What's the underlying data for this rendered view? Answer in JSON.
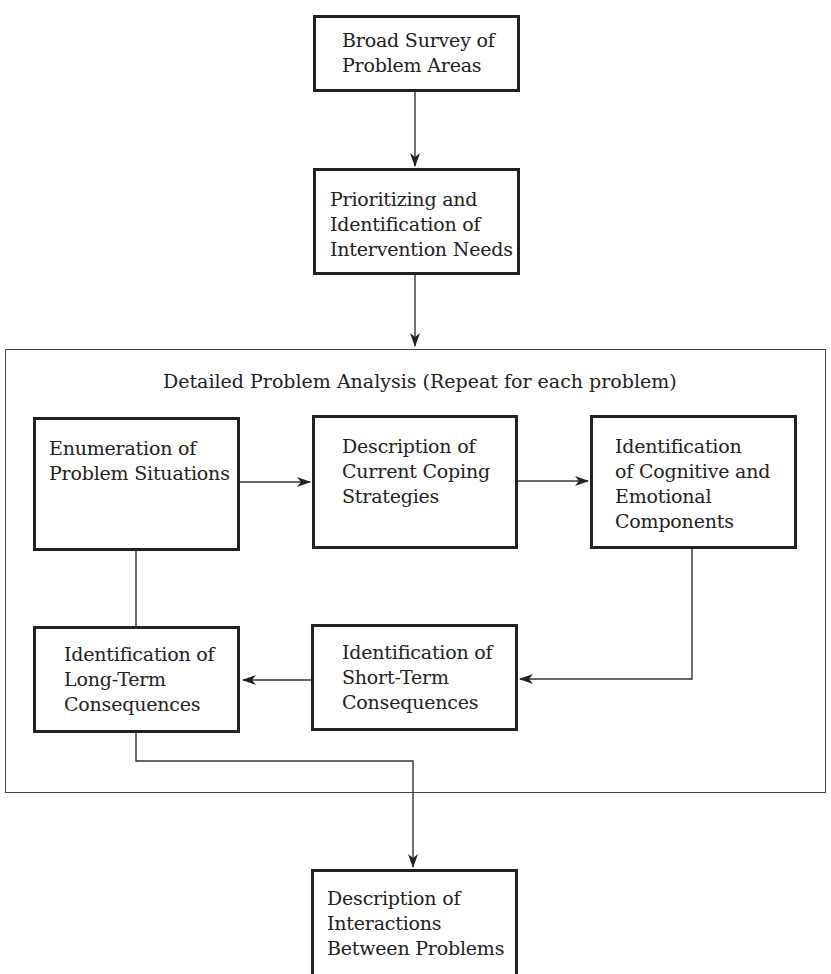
{
  "diagram": {
    "nodes": {
      "broad_survey": "Broad Survey of\nProblem Areas",
      "prioritizing": "Prioritizing and\nIdentification of\nIntervention Needs",
      "enumeration": "Enumeration of\nProblem Situations",
      "coping": "Description of\nCurrent Coping\nStrategies",
      "cognitive": "Identification\nof Cognitive and\nEmotional\nComponents",
      "short_term": "Identification of\nShort-Term\nConsequences",
      "long_term": "Identification of\nLong-Term\nConsequences",
      "interactions": "Description of\nInteractions\nBetween Problems"
    },
    "group": {
      "title": "Detailed Problem Analysis (Repeat for each problem)"
    },
    "edges": [
      {
        "from": "broad_survey",
        "to": "prioritizing"
      },
      {
        "from": "prioritizing",
        "to": "group"
      },
      {
        "from": "enumeration",
        "to": "coping"
      },
      {
        "from": "coping",
        "to": "cognitive"
      },
      {
        "from": "cognitive",
        "to": "short_term"
      },
      {
        "from": "short_term",
        "to": "long_term"
      },
      {
        "from": "enumeration",
        "to": "long_term",
        "arrow": false
      },
      {
        "from": "long_term",
        "to": "interactions"
      }
    ]
  }
}
